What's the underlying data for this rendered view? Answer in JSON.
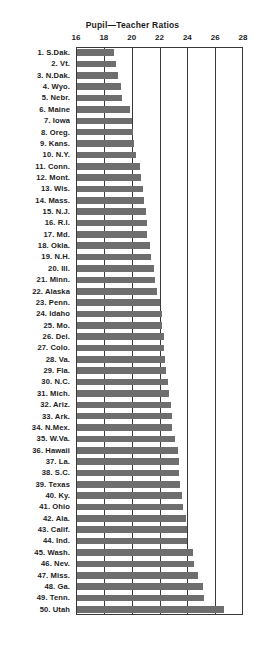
{
  "chart_data": {
    "type": "bar",
    "orientation": "horizontal",
    "title": "Pupil—Teacher Ratios",
    "xlabel": "",
    "ylabel": "",
    "xlim": [
      16,
      28
    ],
    "xticks": [
      16,
      18,
      20,
      22,
      24,
      26,
      28
    ],
    "xtick_labels": [
      "16",
      "18",
      "20",
      "22",
      "24",
      "26",
      "28"
    ],
    "grid": true,
    "gridlines": "vertical",
    "legend": null,
    "bar_color": "#6e6e6e",
    "axis_color": "#3a3a3a",
    "note": "Ranked list of 50 U.S. states by pupil-teacher ratio, lowest to highest.",
    "categories": [
      "1. S.Dak.",
      "2. Vt.",
      "3. N.Dak.",
      "4. Wyo.",
      "5. Nebr.",
      "6. Maine",
      "7. Iowa",
      "8. Oreg.",
      "9. Kans.",
      "10. N.Y.",
      "11. Conn.",
      "12. Mont.",
      "13. Wis.",
      "14. Mass.",
      "15. N.J.",
      "16. R.I.",
      "17. Md.",
      "18. Okla.",
      "19. N.H.",
      "20. Ill.",
      "21. Minn.",
      "22. Alaska",
      "23. Penn.",
      "24. Idaho",
      "25. Mo.",
      "26. Del.",
      "27. Colo.",
      "28. Va.",
      "29. Fla.",
      "30. N.C.",
      "31. Mich.",
      "32. Ariz.",
      "33. Ark.",
      "34. N.Mex.",
      "35. W.Va.",
      "36. Hawaii",
      "37. La.",
      "38. S.C.",
      "39. Texas",
      "40. Ky.",
      "41. Ohio",
      "42. Ala.",
      "43. Calif.",
      "44. Ind.",
      "45. Wash.",
      "46. Nev.",
      "47. Miss.",
      "48. Ga.",
      "49. Tenn.",
      "50. Utah"
    ],
    "values": [
      18.7,
      18.9,
      19.0,
      19.2,
      19.3,
      19.9,
      20.0,
      20.1,
      20.2,
      20.3,
      20.6,
      20.7,
      20.8,
      20.9,
      21.0,
      21.1,
      21.1,
      21.3,
      21.4,
      21.6,
      21.7,
      21.8,
      22.0,
      22.2,
      22.2,
      22.3,
      22.3,
      22.4,
      22.5,
      22.6,
      22.7,
      22.8,
      22.9,
      22.9,
      23.1,
      23.3,
      23.4,
      23.4,
      23.5,
      23.6,
      23.7,
      23.9,
      24.0,
      24.0,
      24.4,
      24.5,
      24.8,
      25.1,
      25.2,
      26.6
    ]
  }
}
